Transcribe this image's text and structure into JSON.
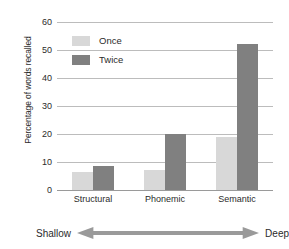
{
  "chart_data": {
    "type": "bar",
    "title": "",
    "xlabel": "",
    "ylabel": "Percentage of words recalled",
    "categories": [
      "Structural",
      "Phonemic",
      "Semantic"
    ],
    "series": [
      {
        "name": "Once",
        "color": "#d8d8d8",
        "values": [
          6.5,
          7,
          19
        ]
      },
      {
        "name": "Twice",
        "color": "#808080",
        "values": [
          8.5,
          20,
          52
        ]
      }
    ],
    "ylim": [
      0,
      60
    ],
    "yticks": [
      0,
      10,
      20,
      30,
      40,
      50,
      60
    ],
    "ytick_labels": [
      "0",
      "10",
      "20",
      "30",
      "40",
      "50",
      "60"
    ],
    "grid": true,
    "legend_position": "upper-left-inside",
    "annotations": {
      "left_label": "Shallow",
      "right_label": "Deep",
      "arrow": "double-headed-horizontal-arrow"
    }
  }
}
